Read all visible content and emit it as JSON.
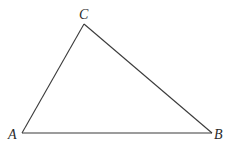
{
  "diagram": {
    "type": "triangle",
    "vertices": [
      {
        "name": "A",
        "x": 22,
        "y": 133,
        "label_x": 8,
        "label_y": 139
      },
      {
        "name": "B",
        "x": 212,
        "y": 133,
        "label_x": 214,
        "label_y": 139
      },
      {
        "name": "C",
        "x": 84,
        "y": 24,
        "label_x": 79,
        "label_y": 19
      }
    ],
    "edges": [
      [
        "A",
        "B"
      ],
      [
        "B",
        "C"
      ],
      [
        "C",
        "A"
      ]
    ],
    "colors": {
      "stroke": "#3a3a3a",
      "label": "#2a2a2a",
      "background": "#ffffff"
    }
  }
}
